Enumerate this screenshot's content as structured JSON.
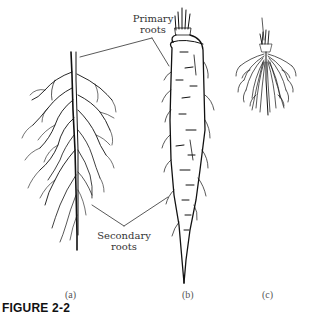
{
  "figure": {
    "caption": "FIGURE 2-2",
    "labels": {
      "primary_roots": [
        "Primary",
        "roots"
      ],
      "secondary_roots": [
        "Secondary",
        "roots"
      ]
    },
    "panels": [
      {
        "id": "a",
        "label": "(a)",
        "subject": "fibrous branching taproot system"
      },
      {
        "id": "b",
        "label": "(b)",
        "subject": "fleshy taproot (carrot)"
      },
      {
        "id": "c",
        "label": "(c)",
        "subject": "fibrous root system (grass)"
      }
    ],
    "colors": {
      "ink": "#111111",
      "background": "#ffffff",
      "label_text": "#333333"
    }
  }
}
